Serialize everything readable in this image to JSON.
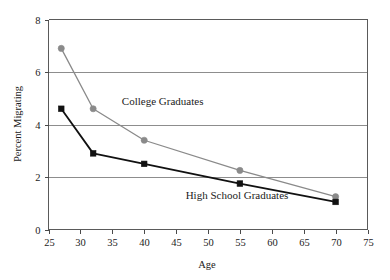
{
  "chart_data": {
    "type": "line",
    "title": "",
    "subtitle": "",
    "xlabel": "Age",
    "ylabel": "Percent Migrating",
    "xlim": [
      25,
      75
    ],
    "ylim": [
      0,
      8
    ],
    "xticks": [
      25,
      30,
      35,
      40,
      45,
      50,
      55,
      60,
      65,
      70,
      75
    ],
    "yticks": [
      0,
      2,
      4,
      6,
      8
    ],
    "xtick_labels": [
      "25",
      "30",
      "35",
      "40",
      "45",
      "50",
      "55",
      "60",
      "65",
      "70",
      "75"
    ],
    "ytick_labels": [
      "0",
      "2",
      "4",
      "6",
      "8"
    ],
    "grid": "horizontal",
    "legend_position": "inline-annotations",
    "series": [
      {
        "name": "College Graduates",
        "color": "#8a8a8a",
        "marker": "circle",
        "x": [
          27,
          32,
          40,
          55,
          70
        ],
        "values": [
          6.9,
          4.6,
          3.4,
          2.25,
          1.25
        ],
        "annotation": "College Graduates",
        "annotation_x": 36.5,
        "annotation_y": 4.75
      },
      {
        "name": "High School Graduates",
        "color": "#111111",
        "marker": "square",
        "x": [
          27,
          32,
          40,
          55,
          70
        ],
        "values": [
          4.6,
          2.9,
          2.5,
          1.75,
          1.05
        ],
        "annotation": "High School Graduates",
        "annotation_x": 46.5,
        "annotation_y": 1.18
      }
    ]
  },
  "axes": {
    "x_axis_title": "Age",
    "y_axis_title": "Percent Migrating"
  },
  "colors": {
    "college_series": "#8a8a8a",
    "highschool_series": "#111111",
    "gridline": "#8d8d8d",
    "frame": "#5a5a5a",
    "background": "#ffffff",
    "text": "#1b1b1b"
  }
}
